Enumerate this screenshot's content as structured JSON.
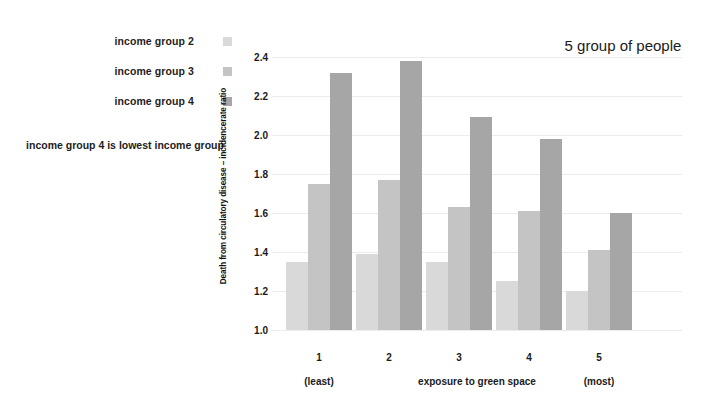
{
  "legend": {
    "items": [
      {
        "label": "income group 2",
        "color": "#d9d9d9",
        "swatch_name": "legend-swatch-income-group-2"
      },
      {
        "label": "income group 3",
        "color": "#c4c4c4",
        "swatch_name": "legend-swatch-income-group-3"
      },
      {
        "label": "income group 4",
        "color": "#a6a6a6",
        "swatch_name": "legend-swatch-income-group-4"
      }
    ],
    "note": "income group 4 is lowest income group"
  },
  "title": "5 group of people",
  "axis": {
    "x_extreme_low": "(least)",
    "x_extreme_high": "(most)"
  },
  "chart_data": {
    "type": "bar",
    "title": "5 group of people",
    "subtitle": "",
    "xlabel": "exposure to green space",
    "ylabel": "Death from circulatory disease – incidencerate ratio",
    "categories": [
      "1",
      "2",
      "3",
      "4",
      "5"
    ],
    "category_notes": {
      "1": "(least)",
      "5": "(most)"
    },
    "series": [
      {
        "name": "income group 2",
        "color": "#d9d9d9",
        "values": [
          1.35,
          1.39,
          1.35,
          1.25,
          1.2
        ]
      },
      {
        "name": "income group 3",
        "color": "#c4c4c4",
        "values": [
          1.75,
          1.77,
          1.63,
          1.61,
          1.41
        ]
      },
      {
        "name": "income group 4",
        "color": "#a6a6a6",
        "values": [
          2.32,
          2.38,
          2.09,
          1.98,
          1.6
        ]
      }
    ],
    "ylim": [
      1.0,
      2.4
    ],
    "ytick_labels": [
      "2.4",
      "2.2",
      "2.0",
      "1.8",
      "1.6",
      "1.4",
      "1.2",
      "1.0"
    ],
    "ytick_values": [
      2.4,
      2.2,
      2.0,
      1.8,
      1.6,
      1.4,
      1.2,
      1.0
    ],
    "grid": true,
    "grid_axis": "y",
    "legend_position": "outside-left",
    "annotation": "income group 4 is lowest income group"
  }
}
